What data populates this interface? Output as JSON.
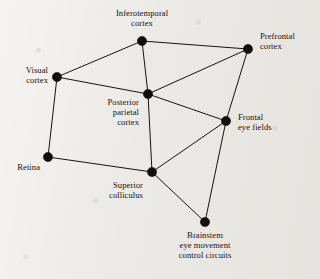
{
  "diagram": {
    "type": "node-link-graph",
    "title_visible": false,
    "background_color": "#eceae6",
    "ink_color": "#16130f",
    "canvas": {
      "width": 320,
      "height": 279
    },
    "nodes": [
      {
        "id": "inferotemporal_cortex",
        "label": "Inferotemporal\ncortex",
        "label_lines": [
          "Inferotemporal",
          "cortex"
        ],
        "x": 142,
        "y": 41,
        "label_x": 142,
        "label_y": 8,
        "label_align": "center"
      },
      {
        "id": "prefrontal_cortex",
        "label": "Prefrontal\ncortex",
        "label_lines": [
          "Prefrontal",
          "cortex"
        ],
        "x": 248,
        "y": 49,
        "label_x": 260,
        "label_y": 31,
        "label_align": "left"
      },
      {
        "id": "visual_cortex",
        "label": "Visual\ncortex",
        "label_lines": [
          "Visual",
          "cortex"
        ],
        "x": 57,
        "y": 77,
        "label_x": 48,
        "label_y": 65,
        "label_align": "right"
      },
      {
        "id": "posterior_parietal_cortex",
        "label": "Posterior\nparietal\ncortex",
        "label_lines": [
          "Posterior",
          "parietal",
          "cortex"
        ],
        "x": 148,
        "y": 94,
        "label_x": 139,
        "label_y": 97,
        "label_align": "right"
      },
      {
        "id": "frontal_eye_fields",
        "label": "Frontal\neye fields",
        "label_lines": [
          "Frontal",
          "eye fields"
        ],
        "x": 226,
        "y": 121,
        "label_x": 238,
        "label_y": 112,
        "label_align": "left"
      },
      {
        "id": "retina",
        "label": "Retina",
        "label_lines": [
          "Retina"
        ],
        "x": 48,
        "y": 157,
        "label_x": 40,
        "label_y": 162,
        "label_align": "right"
      },
      {
        "id": "superior_colliculus",
        "label": "Superior\ncolliculus",
        "label_lines": [
          "Superior",
          "colliculus"
        ],
        "x": 152,
        "y": 172,
        "label_x": 143,
        "label_y": 180,
        "label_align": "right"
      },
      {
        "id": "brainstem_eye_movement_control_circuits",
        "label": "Brainstem\neye movement\ncontrol circuits",
        "label_lines": [
          "Brainstem",
          "eye movement",
          "control circuits"
        ],
        "x": 205,
        "y": 222,
        "label_x": 205,
        "label_y": 230,
        "label_align": "center"
      }
    ],
    "edges": [
      {
        "from": "visual_cortex",
        "to": "inferotemporal_cortex"
      },
      {
        "from": "inferotemporal_cortex",
        "to": "prefrontal_cortex"
      },
      {
        "from": "inferotemporal_cortex",
        "to": "posterior_parietal_cortex"
      },
      {
        "from": "visual_cortex",
        "to": "posterior_parietal_cortex"
      },
      {
        "from": "posterior_parietal_cortex",
        "to": "prefrontal_cortex"
      },
      {
        "from": "posterior_parietal_cortex",
        "to": "frontal_eye_fields"
      },
      {
        "from": "prefrontal_cortex",
        "to": "frontal_eye_fields"
      },
      {
        "from": "visual_cortex",
        "to": "retina"
      },
      {
        "from": "retina",
        "to": "superior_colliculus"
      },
      {
        "from": "posterior_parietal_cortex",
        "to": "superior_colliculus"
      },
      {
        "from": "superior_colliculus",
        "to": "frontal_eye_fields"
      },
      {
        "from": "superior_colliculus",
        "to": "brainstem_eye_movement_control_circuits"
      },
      {
        "from": "frontal_eye_fields",
        "to": "brainstem_eye_movement_control_circuits"
      }
    ],
    "node_radius": 4.6
  }
}
